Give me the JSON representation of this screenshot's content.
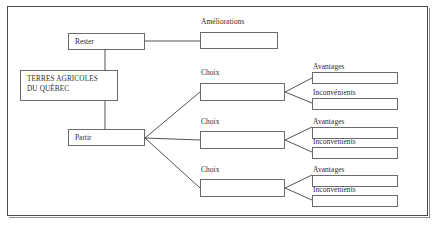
{
  "diagram": {
    "title": "TERRES AGRICOLES DU QUÉBEC",
    "root": {
      "line1": "TERRES AGRICOLES",
      "line2": "DU QUÉBEC"
    },
    "branches": {
      "stay_label": "Rester",
      "leave_label": "Partir"
    },
    "captions": {
      "improvements": "Améliorations",
      "choice": "Choix",
      "advantages": "Avantages",
      "drawbacks": "Inconvénients"
    },
    "groups": [
      {
        "choice_caption": "Choix",
        "choice_value": "",
        "advantages_caption": "Avantages",
        "advantages_value": "",
        "drawbacks_caption": "Inconvénients",
        "drawbacks_value": ""
      },
      {
        "choice_caption": "Choix",
        "choice_value": "",
        "advantages_caption": "Avantages",
        "advantages_value": "",
        "drawbacks_caption": "Inconvénients",
        "drawbacks_value": ""
      },
      {
        "choice_caption": "Choix",
        "choice_value": "",
        "advantages_caption": "Avantages",
        "advantages_value": "",
        "drawbacks_caption": "Inconvénients",
        "drawbacks_value": ""
      }
    ],
    "improvements_value": "",
    "colors": {
      "frame_border": "#4a4a4a",
      "box_border": "#6b6b6b",
      "connector": "#3f3f3f",
      "text": "#2b2b2b",
      "background": "#ffffff"
    }
  }
}
